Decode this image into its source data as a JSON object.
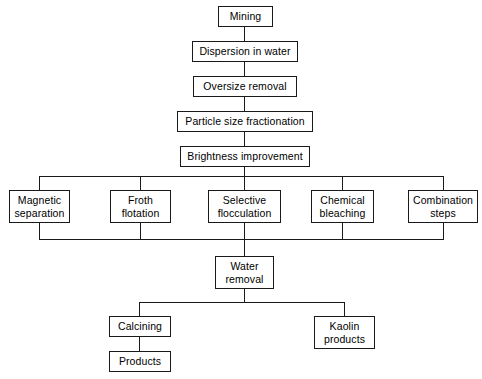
{
  "diagram": {
    "type": "flowchart",
    "orientation": "top-to-bottom",
    "background_color": "#ffffff",
    "line_color": "#1a1a1a",
    "box_fill_color": "#ffffff",
    "text_color": "#000000",
    "nodes": {
      "mining": "Mining",
      "dispersion": "Dispersion in water",
      "oversize_removal": "Oversize removal",
      "particle_size": "Particle size fractionation",
      "brightness": "Brightness improvement",
      "magnetic_separation": "Magnetic\nseparation",
      "froth_flotation": "Froth\nflotation",
      "selective_flocculation": "Selective\nflocculation",
      "chemical_bleaching": "Chemical\nbleaching",
      "combination_steps": "Combination\nsteps",
      "water_removal": "Water\nremoval",
      "calcining": "Calcining",
      "products": "Products",
      "kaolin_products": "Kaolin\nproducts"
    },
    "edges": [
      "mining -> dispersion",
      "dispersion -> oversize_removal",
      "oversize_removal -> particle_size",
      "particle_size -> brightness",
      "brightness -> magnetic_separation",
      "brightness -> froth_flotation",
      "brightness -> selective_flocculation",
      "brightness -> chemical_bleaching",
      "brightness -> combination_steps",
      "magnetic_separation -> water_removal",
      "froth_flotation -> water_removal",
      "selective_flocculation -> water_removal",
      "chemical_bleaching -> water_removal",
      "combination_steps -> water_removal",
      "water_removal -> calcining",
      "water_removal -> kaolin_products",
      "calcining -> products"
    ]
  }
}
